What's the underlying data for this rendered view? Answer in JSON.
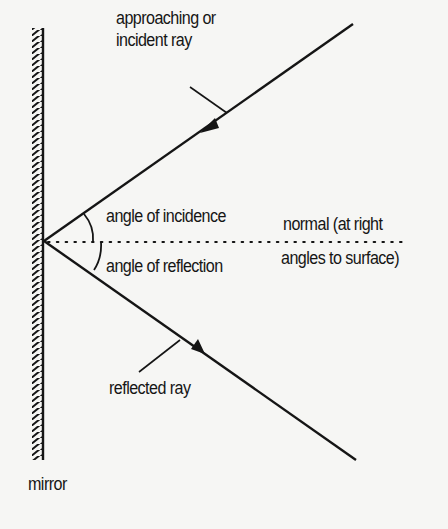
{
  "diagram": {
    "labels": {
      "incident_ray_line1": "approaching or",
      "incident_ray_line2": "incident ray",
      "angle_of_incidence": "angle of incidence",
      "angle_of_reflection": "angle of reflection",
      "normal_line1": "normal (at right",
      "normal_line2": "angles to surface)",
      "reflected_ray": "reflected ray",
      "mirror": "mirror"
    },
    "colors": {
      "background": "#f6f6f4",
      "ink": "#151515"
    },
    "geometry": {
      "mirror": {
        "x": 43,
        "y_top": 28,
        "y_bottom": 460
      },
      "reflection_point": {
        "x": 44,
        "y": 241
      },
      "incident_ray": {
        "from": [
          353,
          24
        ],
        "to": [
          44,
          241
        ]
      },
      "reflected_ray": {
        "from": [
          44,
          241
        ],
        "to": [
          356,
          460
        ]
      },
      "normal": {
        "from": [
          44,
          241
        ],
        "to": [
          405,
          241
        ],
        "style": "dotted"
      }
    }
  }
}
